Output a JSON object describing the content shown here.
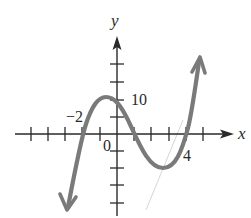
{
  "figure": {
    "type": "function-graph",
    "axes": {
      "x_label": "x",
      "y_label": "y",
      "origin_label": "0",
      "x_ticks": [
        -5,
        -4,
        -3,
        -2,
        -1,
        1,
        2,
        3,
        4,
        5
      ],
      "y_ticks": [
        -20,
        -15,
        -10,
        -5,
        5,
        10,
        15,
        20
      ],
      "x_unit_per_tick": 1,
      "y_unit_per_tick": 5
    },
    "labels": {
      "x_intercept_left": "−2",
      "y_value": "10",
      "x_intercept_right": "4"
    },
    "curve": {
      "description": "cubic polynomial with arrows at both ends",
      "x_intercepts": [
        -2,
        1,
        4
      ],
      "y_intercept": 8,
      "local_max": [
        -0.73,
        10.4
      ],
      "local_min": [
        2.73,
        -10.4
      ],
      "end_behavior": "falls left, rises right",
      "color": "#7a7a7a"
    },
    "colors": {
      "axes": "#2a2a2a",
      "curve": "#7a7a7a",
      "faint_line": "#d6d6d6",
      "background": "#ffffff"
    }
  }
}
